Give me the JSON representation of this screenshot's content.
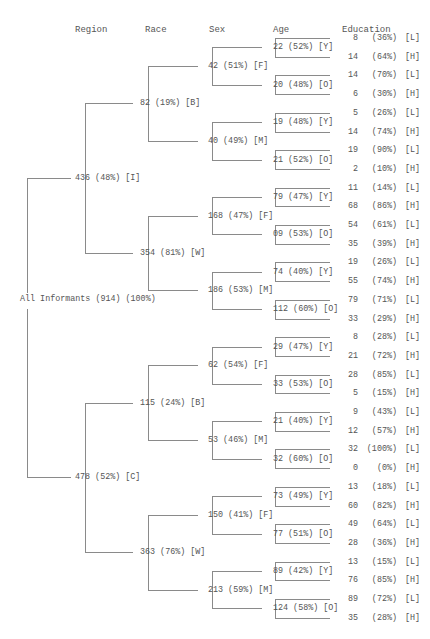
{
  "headers": {
    "region": "Region",
    "race": "Race",
    "sex": "Sex",
    "age": "Age",
    "education": "Education"
  },
  "root": {
    "label": "All Informants (914) (100%)"
  },
  "tree": [
    {
      "label": "436 (48%) [I]",
      "children": [
        {
          "label": "82 (19%) [B]",
          "children": [
            {
              "label": "42 (51%) [F]",
              "children": [
                {
                  "label": "22 (52%) [Y]",
                  "edu": [
                    [
                      "8",
                      "(36%)",
                      "[L]"
                    ],
                    [
                      "14",
                      "(64%)",
                      "[H]"
                    ]
                  ]
                },
                {
                  "label": "20 (48%) [O]",
                  "edu": [
                    [
                      "14",
                      "(70%)",
                      "[L]"
                    ],
                    [
                      "6",
                      "(30%)",
                      "[H]"
                    ]
                  ]
                }
              ]
            },
            {
              "label": "40 (49%) [M]",
              "children": [
                {
                  "label": "19 (48%) [Y]",
                  "edu": [
                    [
                      "5",
                      "(26%)",
                      "[L]"
                    ],
                    [
                      "14",
                      "(74%)",
                      "[H]"
                    ]
                  ]
                },
                {
                  "label": "21 (52%) [O]",
                  "edu": [
                    [
                      "19",
                      "(90%)",
                      "[L]"
                    ],
                    [
                      "2",
                      "(10%)",
                      "[H]"
                    ]
                  ]
                }
              ]
            }
          ]
        },
        {
          "label": "354 (81%) [W]",
          "children": [
            {
              "label": "168 (47%) [F]",
              "children": [
                {
                  "label": "79 (47%) [Y]",
                  "edu": [
                    [
                      "11",
                      "(14%)",
                      "[L]"
                    ],
                    [
                      "68",
                      "(86%)",
                      "[H]"
                    ]
                  ]
                },
                {
                  "label": "09 (53%) [O]",
                  "edu": [
                    [
                      "54",
                      "(61%)",
                      "[L]"
                    ],
                    [
                      "35",
                      "(39%)",
                      "[H]"
                    ]
                  ]
                }
              ]
            },
            {
              "label": "186 (53%) [M]",
              "children": [
                {
                  "label": "74 (40%) [Y]",
                  "edu": [
                    [
                      "19",
                      "(26%)",
                      "[L]"
                    ],
                    [
                      "55",
                      "(74%)",
                      "[H]"
                    ]
                  ]
                },
                {
                  "label": "112 (60%) [O]",
                  "edu": [
                    [
                      "79",
                      "(71%)",
                      "[L]"
                    ],
                    [
                      "33",
                      "(29%)",
                      "[H]"
                    ]
                  ]
                }
              ]
            }
          ]
        }
      ]
    },
    {
      "label": "478 (52%) [C]",
      "children": [
        {
          "label": "115 (24%) [B]",
          "children": [
            {
              "label": "62 (54%) [F]",
              "children": [
                {
                  "label": "29 (47%) [Y]",
                  "edu": [
                    [
                      "8",
                      "(28%)",
                      "[L]"
                    ],
                    [
                      "21",
                      "(72%)",
                      "[H]"
                    ]
                  ]
                },
                {
                  "label": "33 (53%) [O]",
                  "edu": [
                    [
                      "28",
                      "(85%)",
                      "[L]"
                    ],
                    [
                      "5",
                      "(15%)",
                      "[H]"
                    ]
                  ]
                }
              ]
            },
            {
              "label": "53 (46%) [M]",
              "children": [
                {
                  "label": "21 (40%) [Y]",
                  "edu": [
                    [
                      "9",
                      "(43%)",
                      "[L]"
                    ],
                    [
                      "12",
                      "(57%)",
                      "[H]"
                    ]
                  ]
                },
                {
                  "label": "32 (60%) [O]",
                  "edu": [
                    [
                      "32",
                      "(100%)",
                      "[L]"
                    ],
                    [
                      "0",
                      "(0%)",
                      "[H]"
                    ]
                  ]
                }
              ]
            }
          ]
        },
        {
          "label": "363 (76%) [W]",
          "children": [
            {
              "label": "150 (41%) [F]",
              "children": [
                {
                  "label": "73 (49%) [Y]",
                  "edu": [
                    [
                      "13",
                      "(18%)",
                      "[L]"
                    ],
                    [
                      "60",
                      "(82%)",
                      "[H]"
                    ]
                  ]
                },
                {
                  "label": "77 (51%) [O]",
                  "edu": [
                    [
                      "49",
                      "(64%)",
                      "[L]"
                    ],
                    [
                      "28",
                      "(36%)",
                      "[H]"
                    ]
                  ]
                }
              ]
            },
            {
              "label": "213 (59%) [M]",
              "children": [
                {
                  "label": "89 (42%) [Y]",
                  "edu": [
                    [
                      "13",
                      "(15%)",
                      "[L]"
                    ],
                    [
                      "76",
                      "(85%)",
                      "[H]"
                    ]
                  ]
                },
                {
                  "label": "124 (58%) [O]",
                  "edu": [
                    [
                      "89",
                      "(72%)",
                      "[L]"
                    ],
                    [
                      "35",
                      "(28%)",
                      "[H]"
                    ]
                  ]
                }
              ]
            }
          ]
        }
      ]
    }
  ],
  "colors": {
    "text": "#555555",
    "line": "#8a8a8a",
    "background": "#ffffff"
  }
}
